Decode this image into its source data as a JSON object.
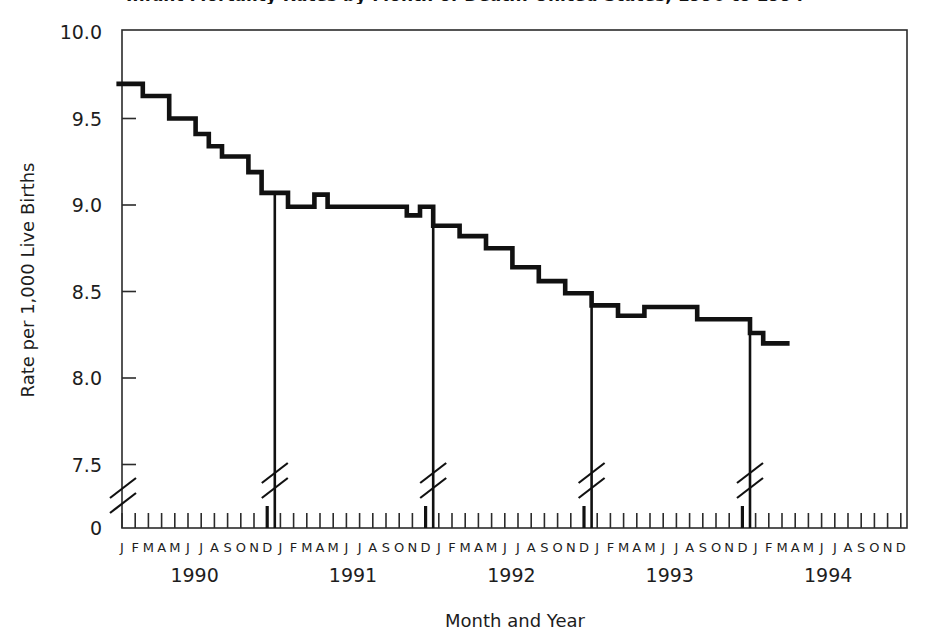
{
  "figure": {
    "title_fragment": "Infant Mortality Rates by Month of Death: United States, 1990 to 1994",
    "title_visible": false
  },
  "axes": {
    "y_label": "Rate per 1,000 Live Births",
    "x_label": "Month and Year",
    "y_ticks": [
      "10.0",
      "9.5",
      "9.0",
      "8.5",
      "8.0",
      "7.5",
      "0"
    ],
    "y_break_between": [
      "7.5",
      "0"
    ],
    "month_letters": [
      "J",
      "F",
      "M",
      "A",
      "M",
      "J",
      "J",
      "A",
      "S",
      "O",
      "N",
      "D"
    ],
    "years": [
      "1990",
      "1991",
      "1992",
      "1993",
      "1994"
    ]
  },
  "chart_data": {
    "type": "line",
    "title": "Infant Mortality Rates by Month of Death: United States, 1990 to 1994",
    "xlabel": "Month and Year",
    "ylabel": "Rate per 1,000 Live Births",
    "ylim": [
      7.5,
      10.0
    ],
    "y_axis_break": true,
    "y_ticks": [
      7.5,
      8.0,
      8.5,
      9.0,
      9.5,
      10.0
    ],
    "grid": false,
    "legend": "none",
    "x_categories": [
      "J 1990",
      "F 1990",
      "M 1990",
      "A 1990",
      "M 1990",
      "J 1990",
      "J 1990",
      "A 1990",
      "S 1990",
      "O 1990",
      "N 1990",
      "D 1990",
      "J 1991",
      "F 1991",
      "M 1991",
      "A 1991",
      "M 1991",
      "J 1991",
      "J 1991",
      "A 1991",
      "S 1991",
      "O 1991",
      "N 1991",
      "D 1991",
      "J 1992",
      "F 1992",
      "M 1992",
      "A 1992",
      "M 1992",
      "J 1992",
      "J 1992",
      "A 1992",
      "S 1992",
      "O 1992",
      "N 1992",
      "D 1992",
      "J 1993",
      "F 1993",
      "M 1993",
      "A 1993",
      "M 1993",
      "J 1993",
      "J 1993",
      "A 1993",
      "S 1993",
      "O 1993",
      "N 1993",
      "D 1993",
      "J 1994",
      "F 1994",
      "M 1994"
    ],
    "values": [
      9.7,
      9.7,
      9.63,
      9.63,
      9.5,
      9.5,
      9.41,
      9.34,
      9.28,
      9.28,
      9.19,
      9.07,
      9.07,
      8.99,
      8.99,
      9.06,
      8.99,
      8.99,
      8.99,
      8.99,
      8.99,
      8.99,
      8.94,
      8.99,
      8.88,
      8.88,
      8.82,
      8.82,
      8.75,
      8.75,
      8.64,
      8.64,
      8.56,
      8.56,
      8.49,
      8.49,
      8.42,
      8.42,
      8.36,
      8.36,
      8.41,
      8.41,
      8.41,
      8.41,
      8.34,
      8.34,
      8.34,
      8.34,
      8.26,
      8.2,
      8.2
    ],
    "series": [
      {
        "name": "Infant mortality rate",
        "color": "#111111",
        "values": [
          9.7,
          9.7,
          9.63,
          9.63,
          9.5,
          9.5,
          9.41,
          9.34,
          9.28,
          9.28,
          9.19,
          9.07,
          9.07,
          8.99,
          8.99,
          9.06,
          8.99,
          8.99,
          8.99,
          8.99,
          8.99,
          8.99,
          8.94,
          8.99,
          8.88,
          8.88,
          8.82,
          8.82,
          8.75,
          8.75,
          8.64,
          8.64,
          8.56,
          8.56,
          8.49,
          8.49,
          8.42,
          8.42,
          8.36,
          8.36,
          8.41,
          8.41,
          8.41,
          8.41,
          8.34,
          8.34,
          8.34,
          8.34,
          8.26,
          8.2,
          8.2
        ]
      }
    ],
    "year_dividers": [
      "D 1990",
      "D 1991",
      "D 1992",
      "D 1993"
    ],
    "annotations": [
      "Vertical rules with axis-break marks separate calendar years at each December."
    ]
  },
  "colors": {
    "line": "#111111",
    "axis": "#2b2b2b",
    "text": "#1d1d1d",
    "background": "#ffffff"
  }
}
